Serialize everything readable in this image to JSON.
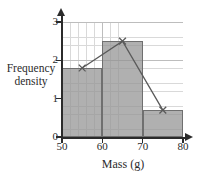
{
  "chart_data": {
    "type": "bar",
    "title": "",
    "xlabel": "Mass (g)",
    "ylabel": "Frequency density",
    "ylabel_lines": [
      "Frequency",
      "density"
    ],
    "xlim": [
      50,
      80
    ],
    "ylim": [
      0,
      3
    ],
    "grid": true,
    "legend": "none",
    "x_ticks": [
      "50",
      "60",
      "70",
      "80"
    ],
    "x_tick_values": [
      50,
      60,
      70,
      80
    ],
    "y_ticks": [
      "0",
      "1",
      "2",
      "3"
    ],
    "y_tick_values": [
      0,
      1,
      2,
      3
    ],
    "categories": [
      "50-60",
      "60-70",
      "70-80"
    ],
    "values": [
      1.8,
      2.5,
      0.7
    ],
    "bars": [
      {
        "label": "50-60",
        "x_start": 50,
        "x_end": 60,
        "value": 1.8
      },
      {
        "label": "60-70",
        "x_start": 60,
        "x_end": 70,
        "value": 2.5
      },
      {
        "label": "70-80",
        "x_start": 70,
        "x_end": 80,
        "value": 0.7
      }
    ],
    "series": [
      {
        "name": "frequency polygon",
        "marker": "x",
        "x": [
          55,
          65,
          75
        ],
        "values": [
          1.8,
          2.5,
          0.7
        ]
      }
    ],
    "colors": {
      "bar_fill": "#919191",
      "bar_edge": "#6f6f6f",
      "line": "#5a5a5a",
      "grid_minor": "#d9d9d9",
      "grid_major": "#bdbdbd",
      "axis": "#2b2b2b"
    }
  }
}
